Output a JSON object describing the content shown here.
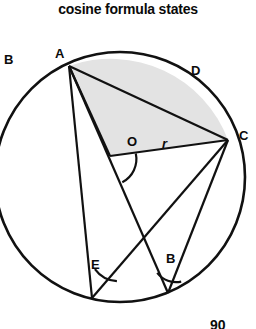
{
  "title": "cosine formula states",
  "figure": {
    "type": "circle-geometry-diagram",
    "circle": {
      "cx": 120,
      "cy": 177,
      "r": 125,
      "stroke": "#111111",
      "stroke_width": 2.6,
      "fill": "none"
    },
    "shaded_region": {
      "description": "circular segment from A over D to C plus triangle A-O-C",
      "fill": "#e2e2e2",
      "stroke": "#111111"
    },
    "points": [
      {
        "id": "A",
        "x": 69,
        "y": 66
      },
      {
        "id": "C",
        "x": 228,
        "y": 140
      },
      {
        "id": "O",
        "x": 110,
        "y": 156
      },
      {
        "id": "E",
        "x": 92,
        "y": 298
      },
      {
        "id": "B",
        "x": 168,
        "y": 293
      }
    ],
    "segments": [
      {
        "from": "A",
        "to": "C",
        "name": "chord-ac"
      },
      {
        "from": "A",
        "to": "O",
        "name": "radius-oa"
      },
      {
        "from": "O",
        "to": "C",
        "name": "radius-oc"
      },
      {
        "from": "A",
        "to": "E",
        "name": "chord-ae"
      },
      {
        "from": "A",
        "to": "B",
        "name": "chord-ab"
      },
      {
        "from": "E",
        "to": "C",
        "name": "chord-ec"
      },
      {
        "from": "B",
        "to": "C",
        "name": "chord-bc"
      }
    ],
    "angle_arcs": [
      {
        "at": "O",
        "name": "angle-at-o"
      },
      {
        "at": "E",
        "name": "angle-at-e"
      },
      {
        "at": "B",
        "name": "angle-at-b"
      }
    ],
    "labels": [
      {
        "id": "label-b-outside",
        "text": "B",
        "x": 4,
        "y": 53
      },
      {
        "id": "label-a",
        "text": "A",
        "x": 55,
        "y": 47
      },
      {
        "id": "label-d",
        "text": "D",
        "x": 191,
        "y": 64
      },
      {
        "id": "label-c",
        "text": "C",
        "x": 239,
        "y": 129
      },
      {
        "id": "label-o",
        "text": "O",
        "x": 127,
        "y": 135
      },
      {
        "id": "label-r",
        "text": "r",
        "x": 162,
        "y": 137
      },
      {
        "id": "label-e",
        "text": "E",
        "x": 91,
        "y": 258
      },
      {
        "id": "label-b-inner",
        "text": "B",
        "x": 166,
        "y": 252
      }
    ],
    "cut_off_text": "90"
  }
}
